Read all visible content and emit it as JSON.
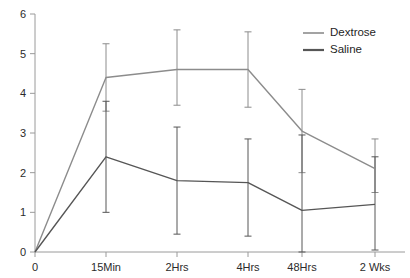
{
  "chart_data": {
    "type": "line",
    "title": "",
    "xlabel": "",
    "ylabel": "",
    "categories": [
      "0",
      "15Min",
      "2Hrs",
      "4Hrs",
      "48Hrs",
      "2 Wks"
    ],
    "ylim": [
      0,
      6
    ],
    "yticks": [
      0,
      1,
      2,
      3,
      4,
      5,
      6
    ],
    "ytick_labels": [
      "0",
      "1",
      "2",
      "3",
      "4",
      "5",
      "6"
    ],
    "grid": false,
    "legend_position": "top-right",
    "error_bars": true,
    "series": [
      {
        "name": "Dextrose",
        "color": "#8c8c8c",
        "values": [
          0,
          4.4,
          4.6,
          4.6,
          3.05,
          2.1
        ],
        "err_low": [
          0,
          3.55,
          3.7,
          3.65,
          2.0,
          1.5
        ],
        "err_high": [
          0,
          5.25,
          5.6,
          5.55,
          4.1,
          2.85
        ]
      },
      {
        "name": "Saline",
        "color": "#565656",
        "values": [
          0,
          2.4,
          1.8,
          1.75,
          1.05,
          1.2
        ],
        "err_low": [
          0,
          1.0,
          0.45,
          0.4,
          0.0,
          0.05
        ],
        "err_high": [
          0,
          3.8,
          3.15,
          2.85,
          2.95,
          2.4
        ]
      }
    ]
  },
  "legend": {
    "items": [
      {
        "label": "Dextrose",
        "color": "#8c8c8c"
      },
      {
        "label": "Saline",
        "color": "#565656"
      }
    ]
  },
  "axes": {
    "y_axis_name": "y-axis",
    "x_axis_name": "x-axis"
  }
}
